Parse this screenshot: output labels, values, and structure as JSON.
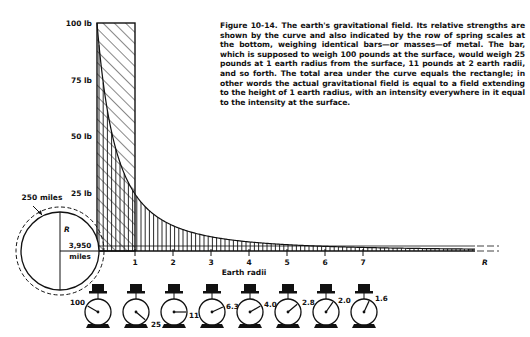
{
  "caption": {
    "figure_label": "Figure 10-14.",
    "text": "The earth's gravitational field. Its relative strengths are shown by the curve and also indicated by the row of spring scales at the bottom, weighing identical bars—or masses—of metal. The bar, which is supposed to weigh 100 pounds at the surface, would weigh 25 pounds at 1 earth radius from the surface, 11 pounds at 2 earth radii, and so forth. The total area under the curve equals the rectangle; in other words the actual gravitational field is equal to a field extending to the height of 1 earth radius, with an intensity everywhere in it equal to the intensity at the surface."
  },
  "y_axis": {
    "labels": [
      "100 lb",
      "75 lb",
      "50 lb",
      "25 lb"
    ],
    "values": [
      100,
      75,
      50,
      25
    ]
  },
  "x_axis": {
    "title": "Earth radii",
    "ticks": [
      "1",
      "2",
      "3",
      "4",
      "5",
      "6",
      "7"
    ],
    "end_label": "R"
  },
  "earth": {
    "atmosphere_label": "250 miles",
    "radius_symbol": "R",
    "radius_value": "3,950",
    "radius_unit": "miles"
  },
  "scales": [
    {
      "reading": "100",
      "value": 100
    },
    {
      "reading": "25",
      "value": 25
    },
    {
      "reading": "11",
      "value": 11
    },
    {
      "reading": "6.3",
      "value": 6.3
    },
    {
      "reading": "4.0",
      "value": 4.0
    },
    {
      "reading": "2.8",
      "value": 2.8
    },
    {
      "reading": "2.0",
      "value": 2.0
    },
    {
      "reading": "1.6",
      "value": 1.6
    }
  ],
  "colors": {
    "ink": "#111111",
    "paper": "#ffffff"
  }
}
